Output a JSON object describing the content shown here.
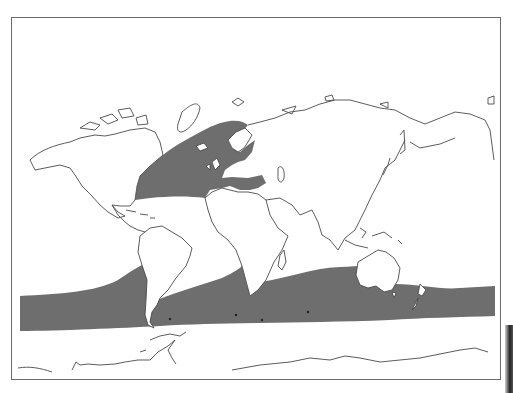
{
  "map": {
    "type": "world outline map (distribution/range map)",
    "projection": "equirectangular-like, Pacific-split",
    "background_color": "#ffffff",
    "coastline_color": "#4a4a4a",
    "range_fill_color": "#6e6e6e",
    "regions_shaded": [
      {
        "id": "north-atlantic",
        "label": "North Atlantic & Mediterranean range"
      },
      {
        "id": "southern-ocean-band",
        "label": "Southern Hemisphere circumpolar band"
      }
    ],
    "landmasses": [
      "North America",
      "South America",
      "Greenland",
      "Europe",
      "Africa",
      "Asia",
      "Australia",
      "New Zealand",
      "Antarctica"
    ]
  }
}
